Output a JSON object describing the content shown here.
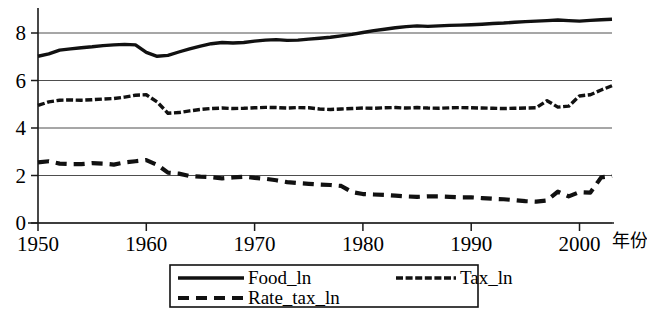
{
  "chart_data": {
    "type": "line",
    "title": "",
    "subtitle": "",
    "xlabel": "年份",
    "ylabel": "",
    "xlim": [
      1950,
      2003
    ],
    "ylim": [
      -0.45,
      9.1
    ],
    "xticks": [
      1950,
      1960,
      1970,
      1980,
      1990,
      2000
    ],
    "xtick_labels": [
      "1950",
      "1960",
      "1970",
      "1980",
      "1990",
      "2000"
    ],
    "yticks": [
      0,
      2,
      4,
      6,
      8
    ],
    "ytick_labels": [
      "0",
      "2",
      "4",
      "6",
      "8"
    ],
    "grid": true,
    "grid_axis": "y",
    "legend_position": "bottom-center",
    "x": [
      1950,
      1951,
      1952,
      1953,
      1954,
      1955,
      1956,
      1957,
      1958,
      1959,
      1960,
      1961,
      1962,
      1963,
      1964,
      1965,
      1966,
      1967,
      1968,
      1969,
      1970,
      1971,
      1972,
      1973,
      1974,
      1975,
      1976,
      1977,
      1978,
      1979,
      1980,
      1981,
      1982,
      1983,
      1984,
      1985,
      1986,
      1987,
      1988,
      1989,
      1990,
      1991,
      1992,
      1993,
      1994,
      1995,
      1996,
      1997,
      1998,
      1999,
      2000,
      2001,
      2002,
      2003
    ],
    "series": [
      {
        "name": "Food_ln",
        "style": "solid",
        "color": "#111111",
        "values": [
          7.02,
          7.12,
          7.28,
          7.33,
          7.38,
          7.42,
          7.47,
          7.5,
          7.52,
          7.5,
          7.18,
          7.02,
          7.06,
          7.2,
          7.33,
          7.45,
          7.55,
          7.6,
          7.58,
          7.6,
          7.66,
          7.7,
          7.72,
          7.69,
          7.7,
          7.74,
          7.78,
          7.82,
          7.88,
          7.94,
          8.02,
          8.1,
          8.16,
          8.22,
          8.27,
          8.3,
          8.28,
          8.3,
          8.32,
          8.33,
          8.35,
          8.37,
          8.4,
          8.42,
          8.45,
          8.48,
          8.5,
          8.52,
          8.55,
          8.52,
          8.5,
          8.53,
          8.56,
          8.58
        ]
      },
      {
        "name": "Tax_ln",
        "style": "dash-dense",
        "color": "#111111",
        "values": [
          4.95,
          5.1,
          5.17,
          5.18,
          5.17,
          5.19,
          5.22,
          5.24,
          5.3,
          5.38,
          5.4,
          5.1,
          4.62,
          4.65,
          4.72,
          4.78,
          4.82,
          4.84,
          4.82,
          4.83,
          4.85,
          4.87,
          4.86,
          4.84,
          4.86,
          4.85,
          4.8,
          4.78,
          4.8,
          4.82,
          4.84,
          4.83,
          4.85,
          4.86,
          4.84,
          4.86,
          4.84,
          4.83,
          4.85,
          4.86,
          4.85,
          4.84,
          4.83,
          4.82,
          4.83,
          4.84,
          4.85,
          5.15,
          4.88,
          4.92,
          5.35,
          5.4,
          5.6,
          5.78
        ]
      },
      {
        "name": "Rate_tax_ln",
        "style": "dash-long",
        "color": "#111111",
        "values": [
          2.55,
          2.6,
          2.5,
          2.48,
          2.48,
          2.52,
          2.5,
          2.46,
          2.55,
          2.6,
          2.65,
          2.45,
          2.12,
          2.08,
          1.98,
          1.95,
          1.93,
          1.88,
          1.92,
          1.95,
          1.9,
          1.86,
          1.8,
          1.72,
          1.68,
          1.65,
          1.62,
          1.6,
          1.56,
          1.3,
          1.22,
          1.2,
          1.18,
          1.15,
          1.12,
          1.1,
          1.12,
          1.12,
          1.1,
          1.08,
          1.08,
          1.05,
          1.02,
          1.0,
          0.96,
          0.92,
          0.9,
          0.95,
          1.32,
          1.12,
          1.3,
          1.28,
          1.92,
          1.98
        ]
      }
    ],
    "legend": [
      {
        "label": "Food_ln",
        "style": "solid"
      },
      {
        "label": "Tax_ln",
        "style": "dash-dense"
      },
      {
        "label": "Rate_tax_ln",
        "style": "dash-long"
      }
    ]
  }
}
